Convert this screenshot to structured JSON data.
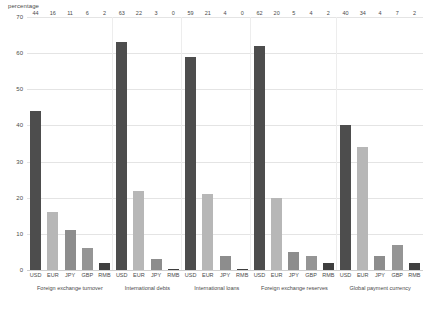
{
  "chart_data": {
    "type": "bar",
    "title": "",
    "subtitle": "",
    "xlabel": "",
    "ylabel": "percentage",
    "ylim": [
      0,
      70
    ],
    "ytick_step": 10,
    "yticks": [
      "0",
      "10",
      "20",
      "30",
      "40",
      "50",
      "60",
      "70"
    ],
    "grid": true,
    "legend": "none",
    "grouped": true,
    "group_labels": [
      "Foreign exchange turnover",
      "International debts",
      "International loans",
      "Foreign exchange reserves",
      "Global payment currency"
    ],
    "groups": [
      {
        "label": "Foreign exchange turnover",
        "categories": [
          "USD",
          "EUR",
          "JPY",
          "GBP",
          "RMB"
        ],
        "values": [
          44,
          16,
          11,
          6,
          2
        ]
      },
      {
        "label": "International debts",
        "categories": [
          "USD",
          "EUR",
          "JPY",
          "RMB"
        ],
        "values": [
          63,
          22,
          3,
          0
        ]
      },
      {
        "label": "International loans",
        "categories": [
          "USD",
          "EUR",
          "JPY",
          "RMB"
        ],
        "values": [
          59,
          21,
          4,
          0
        ]
      },
      {
        "label": "Foreign exchange reserves",
        "categories": [
          "USD",
          "EUR",
          "JPY",
          "GBP",
          "RMB"
        ],
        "values": [
          62,
          20,
          5,
          4,
          2
        ]
      },
      {
        "label": "Global payment currency",
        "categories": [
          "USD",
          "EUR",
          "JPY",
          "GBP",
          "RMB"
        ],
        "values": [
          40,
          34,
          4,
          7,
          2
        ]
      }
    ],
    "series_colors": {
      "USD": "#4d4d4d",
      "EUR": "#b7b7b7",
      "JPY": "#8d8d8d",
      "GBP": "#959595",
      "RMB": "#3f3f3f"
    }
  },
  "axis": {
    "y_title": "percentage"
  }
}
